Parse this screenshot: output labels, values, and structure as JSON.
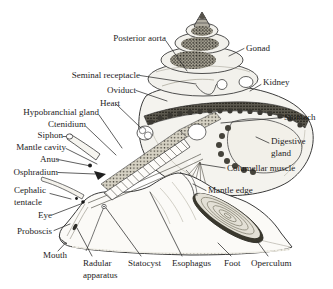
{
  "figure": {
    "type": "anatomical line diagram",
    "colors": {
      "background": "#ffffff",
      "ink": "#2b2b2b",
      "shell_fill": "#f4f3ee",
      "gonad_stipple": "#23211c"
    },
    "labels": {
      "posterior_aorta": "Posterior aorta",
      "gonad": "Gonad",
      "seminal_receptacle": "Seminal receptacle",
      "oviduct": "Oviduct",
      "heart": "Heart",
      "kidney": "Kidney",
      "hypobranchial_gland": "Hypobranchial gland",
      "ctenidium": "Ctenidium",
      "siphon": "Siphon",
      "mantle_cavity": "Mantle cavity",
      "anus": "Anus",
      "osphradium": "Osphradium",
      "stomach": "Stomach",
      "digestive_gland": "Digestive gland",
      "columellar_muscle": "Columellar muscle",
      "mantle_edge": "Mantle edge",
      "cephalic_tentacle": "Cephalic tentacle",
      "eye": "Eye",
      "proboscis": "Proboscis",
      "mouth": "Mouth",
      "radular_apparatus": "Radular apparatus",
      "statocyst": "Statocyst",
      "esophagus": "Esophagus",
      "foot": "Foot",
      "operculum": "Operculum"
    }
  }
}
